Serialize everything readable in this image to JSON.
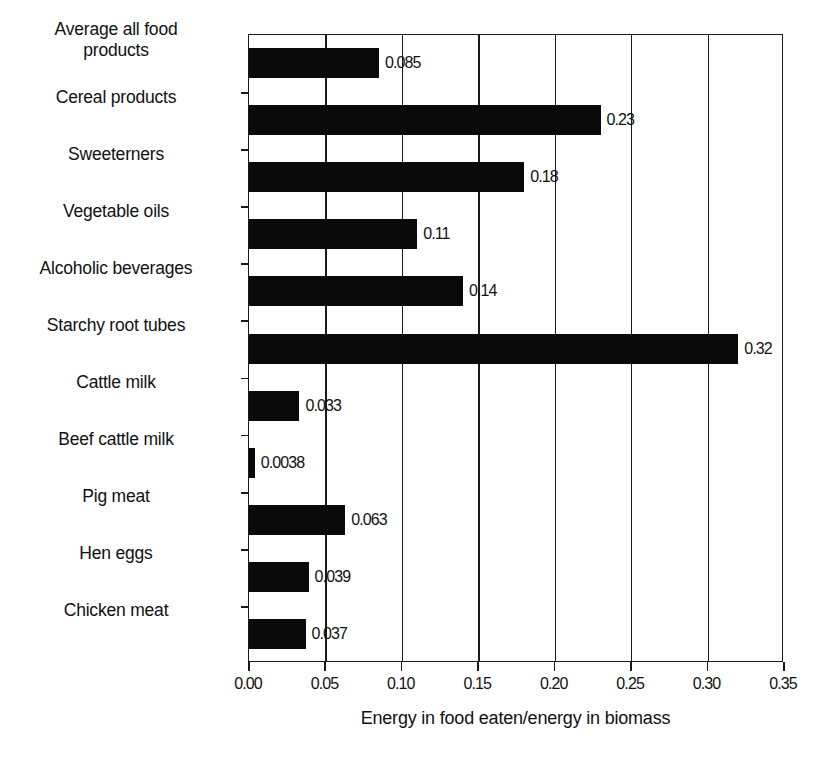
{
  "chart_data": {
    "type": "bar",
    "orientation": "horizontal",
    "title": "",
    "xlabel": "Energy in food eaten/energy in biomass",
    "ylabel": "",
    "xlim": [
      0.0,
      0.35
    ],
    "ylim": null,
    "grid": true,
    "grid_axis": "x",
    "legend": false,
    "bar_color": "#0a0a0a",
    "categories": [
      "Average all food products",
      "Cereal products",
      "Sweeterners",
      "Vegetable oils",
      "Alcoholic beverages",
      "Starchy root tubes",
      "Cattle milk",
      "Beef cattle milk",
      "Pig meat",
      "Hen eggs",
      "Chicken meat"
    ],
    "values": [
      0.085,
      0.23,
      0.18,
      0.11,
      0.14,
      0.32,
      0.033,
      0.0038,
      0.063,
      0.039,
      0.037
    ],
    "value_labels": [
      "0.085",
      "0.23",
      "0.18",
      "0.11",
      "0.14",
      "0.32",
      "0.033",
      "0.0038",
      "0.063",
      "0.039",
      "0.037"
    ],
    "xticks": [
      0.0,
      0.05,
      0.1,
      0.15,
      0.2,
      0.25,
      0.3,
      0.35
    ],
    "xtick_labels": [
      "0.00",
      "0.05",
      "0.10",
      "0.15",
      "0.20",
      "0.25",
      "0.30",
      "0.35"
    ]
  },
  "axis": {
    "x_title": "Energy in food eaten/energy in biomass"
  },
  "categories": [
    {
      "label_line1": "Average all food",
      "label_line2": "products",
      "value_label": "0.085"
    },
    {
      "label_line1": "Cereal products",
      "label_line2": "",
      "value_label": "0.23"
    },
    {
      "label_line1": "Sweeterners",
      "label_line2": "",
      "value_label": "0.18"
    },
    {
      "label_line1": "Vegetable oils",
      "label_line2": "",
      "value_label": "0.11"
    },
    {
      "label_line1": "Alcoholic beverages",
      "label_line2": "",
      "value_label": "0.14"
    },
    {
      "label_line1": "Starchy root tubes",
      "label_line2": "",
      "value_label": "0.32"
    },
    {
      "label_line1": "Cattle milk",
      "label_line2": "",
      "value_label": "0.033"
    },
    {
      "label_line1": "Beef cattle milk",
      "label_line2": "",
      "value_label": "0.0038"
    },
    {
      "label_line1": "Pig meat",
      "label_line2": "",
      "value_label": "0.063"
    },
    {
      "label_line1": "Hen eggs",
      "label_line2": "",
      "value_label": "0.039"
    },
    {
      "label_line1": "Chicken meat",
      "label_line2": "",
      "value_label": "0.037"
    }
  ]
}
